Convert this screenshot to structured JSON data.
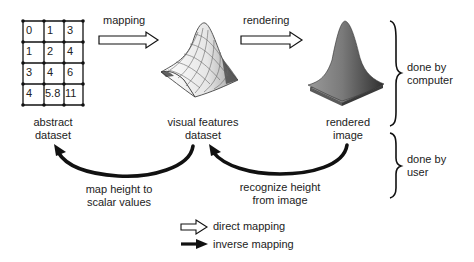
{
  "abstract_dataset": {
    "grid": [
      [
        "0",
        "1",
        "3"
      ],
      [
        "1",
        "2",
        "4"
      ],
      [
        "3",
        "4",
        "6"
      ],
      [
        "4",
        "5.8",
        "11"
      ]
    ],
    "label_line1": "abstract",
    "label_line2": "dataset"
  },
  "visual_features": {
    "label_line1": "visual features",
    "label_line2": "dataset",
    "icon": "wireframe-surface"
  },
  "rendered": {
    "label_line1": "rendered",
    "label_line2": "image",
    "icon": "shaded-gaussian-surface"
  },
  "arrows": {
    "mapping_label": "mapping",
    "rendering_label": "rendering",
    "left_inverse_line1": "map height to",
    "left_inverse_line2": "scalar values",
    "right_inverse_line1": "recognize height",
    "right_inverse_line2": "from image"
  },
  "braces": {
    "computer_line1": "done by",
    "computer_line2": "computer",
    "user_line1": "done by",
    "user_line2": "user"
  },
  "legend": {
    "direct": "direct mapping",
    "inverse": "inverse mapping"
  },
  "colors": {
    "ink": "#111111",
    "text": "#222222",
    "surface_light": "#f2f2f2",
    "surface_dark": "#555555",
    "rendered_fill": "#6e6e6e"
  }
}
